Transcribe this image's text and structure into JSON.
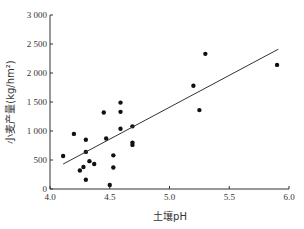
{
  "chart_data": {
    "type": "scatter",
    "title": "",
    "xlabel": "土壤pH",
    "ylabel": "小麦产量(kg/hm²)",
    "xlim": [
      4.0,
      6.0
    ],
    "ylim": [
      0,
      3000
    ],
    "xticks": [
      4.0,
      4.5,
      5.0,
      5.5,
      6.0
    ],
    "xtick_labels": [
      "4.0",
      "4.5",
      "5.0",
      "5.5",
      "6.0"
    ],
    "yticks": [
      0,
      500,
      1000,
      1500,
      2000,
      2500,
      3000
    ],
    "ytick_labels": [
      "0",
      "500",
      "1 000",
      "1 500",
      "2 000",
      "2 500",
      "3 000"
    ],
    "grid": false,
    "legend": null,
    "series": [
      {
        "name": "samples",
        "points": [
          {
            "x": 4.11,
            "y": 570
          },
          {
            "x": 4.2,
            "y": 950
          },
          {
            "x": 4.3,
            "y": 850
          },
          {
            "x": 4.3,
            "y": 640
          },
          {
            "x": 4.33,
            "y": 480
          },
          {
            "x": 4.28,
            "y": 380
          },
          {
            "x": 4.25,
            "y": 320
          },
          {
            "x": 4.3,
            "y": 160
          },
          {
            "x": 4.37,
            "y": 430
          },
          {
            "x": 4.45,
            "y": 1320
          },
          {
            "x": 4.47,
            "y": 870
          },
          {
            "x": 4.53,
            "y": 580
          },
          {
            "x": 4.53,
            "y": 370
          },
          {
            "x": 4.5,
            "y": 70
          },
          {
            "x": 4.59,
            "y": 1490
          },
          {
            "x": 4.59,
            "y": 1330
          },
          {
            "x": 4.59,
            "y": 1040
          },
          {
            "x": 4.69,
            "y": 1080
          },
          {
            "x": 4.69,
            "y": 800
          },
          {
            "x": 4.69,
            "y": 760
          },
          {
            "x": 5.2,
            "y": 1780
          },
          {
            "x": 5.25,
            "y": 1360
          },
          {
            "x": 5.3,
            "y": 2330
          },
          {
            "x": 5.9,
            "y": 2140
          }
        ]
      }
    ],
    "trendline": {
      "x1": 4.11,
      "y1": 430,
      "x2": 5.91,
      "y2": 2410
    }
  }
}
